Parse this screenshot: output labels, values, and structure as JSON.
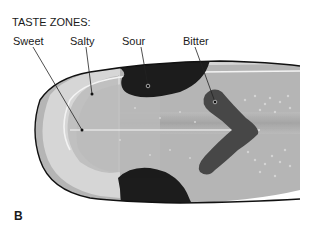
{
  "figure": {
    "title": "TASTE ZONES:",
    "panel_label": "B",
    "labels": {
      "sweet": "Sweet",
      "salty": "Salty",
      "sour": "Sour",
      "bitter": "Bitter"
    }
  },
  "colors": {
    "tongue_fill": "#b3b3b3",
    "tongue_center": "#a6a6a6",
    "outline": "#111111",
    "sweet_zone": "#d9d9d9",
    "salty_zone": "#d4d4d4",
    "sour_zone": "#1c1c1c",
    "bitter_zone": "#4a4a4a",
    "highlight": "#f2f2f2"
  }
}
